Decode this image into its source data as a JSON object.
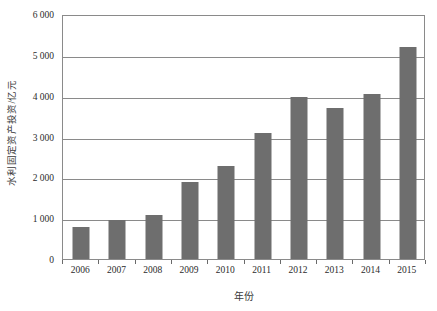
{
  "chart_data": {
    "type": "bar",
    "title": "",
    "xlabel": "年份",
    "ylabel": "水利固定资产投资/亿元",
    "categories": [
      "2006",
      "2007",
      "2008",
      "2009",
      "2010",
      "2011",
      "2012",
      "2013",
      "2014",
      "2015"
    ],
    "values": [
      790,
      950,
      1090,
      1890,
      2290,
      3080,
      3960,
      3700,
      4050,
      5200
    ],
    "ylim": [
      0,
      6000
    ],
    "ytick_step": 1000,
    "ytick_labels": [
      "0",
      "1 000",
      "2 000",
      "3 000",
      "4 000",
      "5 000",
      "6 000"
    ],
    "ytick_values": [
      0,
      1000,
      2000,
      3000,
      4000,
      5000,
      6000
    ],
    "grid": "horizontal",
    "legend": "none",
    "series": [
      {
        "name": "水利固定资产投资",
        "values": [
          790,
          950,
          1090,
          1890,
          2290,
          3080,
          3960,
          3700,
          4050,
          5200
        ]
      }
    ],
    "colors": {
      "bar": "#6e6e6e",
      "gridline": "#8a8a8a",
      "axis": "#8a8a8a",
      "text": "#2b2b2b",
      "background": "#ffffff"
    }
  }
}
